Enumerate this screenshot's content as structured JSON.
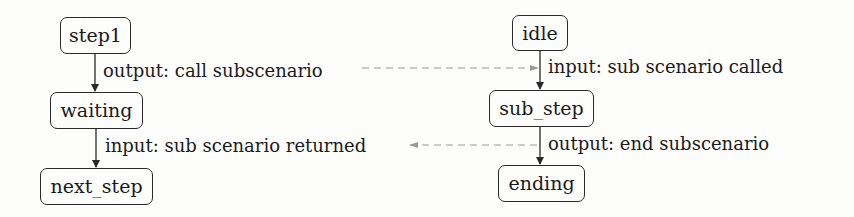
{
  "left_chain": {
    "nodes": [
      {
        "label": "step1"
      },
      {
        "label": "waiting"
      },
      {
        "label": "next_step"
      }
    ],
    "transitions": [
      {
        "label": "output: call subscenario"
      },
      {
        "label": "input: sub scenario returned"
      }
    ]
  },
  "right_chain": {
    "nodes": [
      {
        "label": "idle"
      },
      {
        "label": "sub_step"
      },
      {
        "label": "ending"
      }
    ],
    "transitions": [
      {
        "label": "input: sub scenario called"
      },
      {
        "label": "output: end subscenario"
      }
    ]
  },
  "links": [
    {
      "from": "output: call subscenario",
      "to": "input: sub scenario called",
      "style": "dashed",
      "color": "#9a9a9a"
    },
    {
      "from": "output: end subscenario",
      "to": "input: sub scenario returned",
      "style": "dashed",
      "color": "#9a9a9a"
    }
  ],
  "colors": {
    "edge": "#2a2a2a",
    "dashed": "#9a9a9a",
    "background": "#fdfdfc"
  }
}
